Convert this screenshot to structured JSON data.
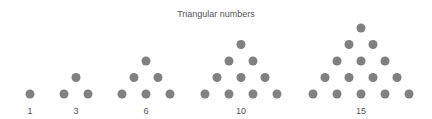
{
  "title": "Triangular numbers",
  "dot_color": "#808080",
  "dot_radius": 4.5,
  "row_spacing_y": 16.5,
  "dot_spacing_x": 24,
  "base_y": 94,
  "chart_data": {
    "type": "diagram",
    "title": "Triangular numbers",
    "items": [
      {
        "label": "1",
        "rows": 1,
        "center_x": 30
      },
      {
        "label": "3",
        "rows": 2,
        "center_x": 76
      },
      {
        "label": "6",
        "rows": 3,
        "center_x": 146
      },
      {
        "label": "10",
        "rows": 4,
        "center_x": 241
      },
      {
        "label": "15",
        "rows": 5,
        "center_x": 361
      }
    ]
  }
}
